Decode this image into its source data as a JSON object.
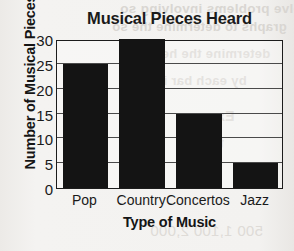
{
  "chart_data": {
    "type": "bar",
    "title": "Musical Pieces Heard",
    "xlabel": "Type of Music",
    "ylabel": "Number of Musical Pieces",
    "categories": [
      "Pop",
      "Country",
      "Concertos",
      "Jazz"
    ],
    "values": [
      25,
      30,
      15,
      5
    ],
    "ylim": [
      0,
      30
    ],
    "yticks": [
      30,
      25,
      20,
      15,
      10,
      5,
      0
    ],
    "grid": true,
    "legend": false,
    "bar_color": "#141414",
    "axis_color": "#1c1c1c",
    "background_color": "#f2f1ef"
  },
  "background_bleed": {
    "note": "faint mirrored text bleeding through from reverse of scanned page",
    "lines": [
      "o solve problems involving so",
      "graphs to determine the so",
      "determine the hele",
      "by each bar in",
      "Exam",
      "tura",
      "500  1,100   2,000"
    ]
  }
}
